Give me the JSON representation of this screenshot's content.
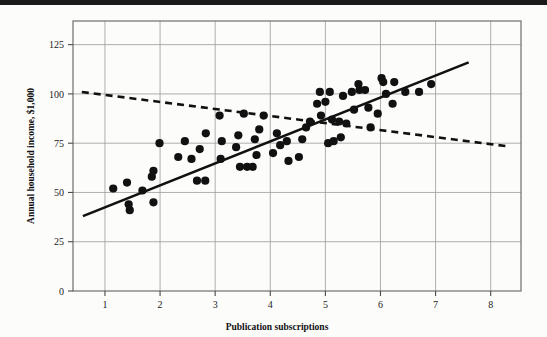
{
  "figure": {
    "background_color": "#fcfcfb",
    "top_rule_color": "#1a1a1a",
    "frame_color": "#6e6e6e",
    "grid_color": "#9a9a9a",
    "marker_color": "#111111",
    "solid_line_color": "#111111",
    "dashed_line_color": "#111111"
  },
  "chart_data": {
    "type": "scatter",
    "title": "",
    "subtitle": "",
    "xlabel": "Publication subscriptions",
    "ylabel": "Annual household income, $1,000",
    "xlim": [
      0.42,
      8.55
    ],
    "ylim": [
      0,
      137
    ],
    "xticks": [
      1,
      2,
      3,
      4,
      5,
      6,
      7,
      8
    ],
    "xtick_labels": [
      "1",
      "2",
      "3",
      "4",
      "5",
      "6",
      "7",
      "8"
    ],
    "yticks": [
      0,
      25,
      50,
      75,
      100,
      125
    ],
    "ytick_labels": [
      "0",
      "25",
      "50",
      "75",
      "100",
      "125"
    ],
    "grid": true,
    "grid_axes": "both",
    "legend": null,
    "legend_position": "none",
    "annotations": [],
    "series": [
      {
        "name": "Observations",
        "type": "scatter",
        "marker": "circle",
        "marker_size": 6,
        "color": "#111111",
        "points": [
          [
            1.15,
            52
          ],
          [
            1.4,
            55
          ],
          [
            1.43,
            44
          ],
          [
            1.45,
            41
          ],
          [
            1.68,
            51
          ],
          [
            1.85,
            58
          ],
          [
            1.88,
            61
          ],
          [
            1.88,
            45
          ],
          [
            1.99,
            75
          ],
          [
            2.33,
            68
          ],
          [
            2.45,
            76
          ],
          [
            2.57,
            67
          ],
          [
            2.67,
            56
          ],
          [
            2.72,
            72
          ],
          [
            2.82,
            56
          ],
          [
            2.83,
            80
          ],
          [
            3.08,
            89
          ],
          [
            3.1,
            67
          ],
          [
            3.12,
            76
          ],
          [
            3.38,
            73
          ],
          [
            3.42,
            79
          ],
          [
            3.45,
            63
          ],
          [
            3.52,
            90
          ],
          [
            3.58,
            63
          ],
          [
            3.68,
            63
          ],
          [
            3.72,
            77
          ],
          [
            3.75,
            69
          ],
          [
            3.8,
            82
          ],
          [
            3.88,
            89
          ],
          [
            4.05,
            70
          ],
          [
            4.12,
            80
          ],
          [
            4.18,
            74
          ],
          [
            4.3,
            76
          ],
          [
            4.33,
            66
          ],
          [
            4.52,
            68
          ],
          [
            4.58,
            77
          ],
          [
            4.65,
            83
          ],
          [
            4.72,
            86
          ],
          [
            4.85,
            95
          ],
          [
            4.9,
            101
          ],
          [
            4.92,
            89
          ],
          [
            5.0,
            96
          ],
          [
            5.05,
            75
          ],
          [
            5.08,
            101
          ],
          [
            5.12,
            87
          ],
          [
            5.15,
            76
          ],
          [
            5.25,
            86
          ],
          [
            5.28,
            78
          ],
          [
            5.32,
            99
          ],
          [
            5.38,
            85
          ],
          [
            5.48,
            101
          ],
          [
            5.52,
            92
          ],
          [
            5.6,
            105
          ],
          [
            5.62,
            102
          ],
          [
            5.72,
            102
          ],
          [
            5.78,
            93
          ],
          [
            5.82,
            83
          ],
          [
            5.95,
            90
          ],
          [
            6.02,
            108
          ],
          [
            6.05,
            106
          ],
          [
            6.1,
            100
          ],
          [
            6.22,
            95
          ],
          [
            6.25,
            106
          ],
          [
            6.45,
            101
          ],
          [
            6.7,
            101
          ],
          [
            6.92,
            105
          ]
        ]
      },
      {
        "name": "Solid trend line",
        "type": "line",
        "style": "solid",
        "color": "#111111",
        "width": 2.6,
        "endpoints": [
          [
            0.6,
            38
          ],
          [
            7.6,
            116
          ]
        ]
      },
      {
        "name": "Dashed trend line",
        "type": "line",
        "style": "dashed",
        "color": "#111111",
        "width": 2.6,
        "dash_pattern": "7 5",
        "endpoints": [
          [
            0.58,
            101
          ],
          [
            8.28,
            73.5
          ]
        ]
      }
    ]
  }
}
